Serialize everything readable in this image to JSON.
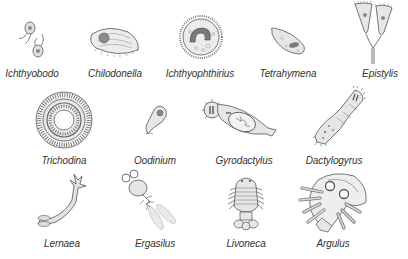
{
  "figure": {
    "title": "",
    "colors": {
      "outline": "#555555",
      "fill_light": "#e6e6e6",
      "fill_mid": "#bdbdbd",
      "fill_dark": "#8a8a8a",
      "label": "#333333",
      "background": "#ffffff"
    },
    "organisms": [
      {
        "name": "Ichthyobodo",
        "row": 1,
        "label_x": 32,
        "label_y": 66
      },
      {
        "name": "Chilodonella",
        "row": 1,
        "label_x": 115,
        "label_y": 66
      },
      {
        "name": "Ichthyophthirius",
        "row": 1,
        "label_x": 200,
        "label_y": 66
      },
      {
        "name": "Tetrahymena",
        "row": 1,
        "label_x": 288,
        "label_y": 66
      },
      {
        "name": "Epistylis",
        "row": 1,
        "label_x": 380,
        "label_y": 66
      },
      {
        "name": "Trichodina",
        "row": 2,
        "label_x": 64,
        "label_y": 155
      },
      {
        "name": "Oodinium",
        "row": 2,
        "label_x": 155,
        "label_y": 155
      },
      {
        "name": "Gyrodactylus",
        "row": 2,
        "label_x": 244,
        "label_y": 155
      },
      {
        "name": "Dactylogyrus",
        "row": 2,
        "label_x": 334,
        "label_y": 155
      },
      {
        "name": "Lernaea",
        "row": 3,
        "label_x": 62,
        "label_y": 238
      },
      {
        "name": "Ergasilus",
        "row": 3,
        "label_x": 155,
        "label_y": 238
      },
      {
        "name": "Livoneca",
        "row": 3,
        "label_x": 246,
        "label_y": 238
      },
      {
        "name": "Argulus",
        "row": 3,
        "label_x": 333,
        "label_y": 238
      }
    ]
  }
}
